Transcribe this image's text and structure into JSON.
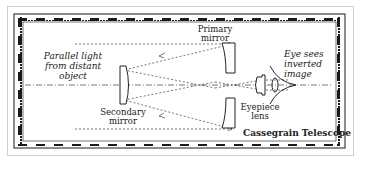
{
  "diagram": {
    "title": "Cassegrain Telescope",
    "labels": {
      "parallel_light": [
        "Parallel light",
        "from distant",
        "object"
      ],
      "primary_mirror": [
        "Primary",
        "mirror"
      ],
      "secondary_mirror": [
        "Secondary",
        "mirror"
      ],
      "eyepiece_lens": [
        "Eyepiece",
        "lens"
      ],
      "eye_sees": [
        "Eye sees",
        "inverted",
        "image"
      ]
    },
    "colors": {
      "ink": "#222222",
      "ray": "#555555",
      "border_dark": "#1a1a1a",
      "frame_light": "#cfcfcf",
      "background": "#ffffff"
    }
  }
}
